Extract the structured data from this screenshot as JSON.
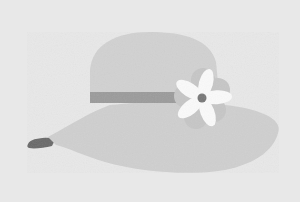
{
  "image": {
    "subject": "Wide-brim sun hat with band and flower",
    "alt": "Grayscale illustration of a wide-brimmed sun hat with a darker band and a white flower on the side"
  },
  "colors": {
    "background": "#e8e8e8",
    "hat": "#cfcfcf",
    "crown_shade": "#d2d2d2",
    "band": "#9b9b9b",
    "brim_tip": "#686868",
    "petal_white": "#fafafa",
    "petal_back": "#c4c4c4",
    "flower_center": "#777777"
  }
}
